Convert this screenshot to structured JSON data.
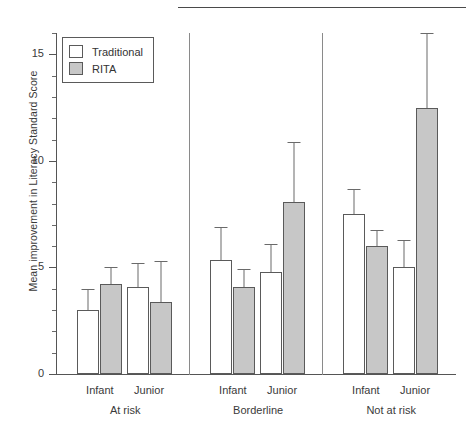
{
  "chart_data": {
    "type": "bar",
    "title": "",
    "xlabel": "",
    "ylabel": "Mean improvement in Literacy Standard Score",
    "ylim": [
      0,
      16
    ],
    "yticks": [
      0,
      5,
      10,
      15
    ],
    "ytick_labels": [
      "0",
      "5",
      "10",
      "15"
    ],
    "minor_tick_step": 1,
    "grid": false,
    "legend_position": "top-left",
    "legend": [
      "Traditional",
      "RITA"
    ],
    "group_labels": [
      "At risk",
      "Borderline",
      "Not at risk"
    ],
    "categories": [
      "At risk / Infant",
      "At risk / Junior",
      "Borderline / Infant",
      "Borderline / Junior",
      "Not at risk / Infant",
      "Not at risk / Junior"
    ],
    "subgroup_labels": [
      "Infant",
      "Junior",
      "Infant",
      "Junior",
      "Infant",
      "Junior"
    ],
    "series": [
      {
        "name": "Traditional",
        "color": "#ffffff",
        "values": [
          3.0,
          4.1,
          5.35,
          4.8,
          7.5,
          5.0
        ],
        "error_upper": [
          4.0,
          5.2,
          6.9,
          6.1,
          8.7,
          6.3
        ]
      },
      {
        "name": "RITA",
        "color": "#c7c7c7",
        "values": [
          4.2,
          3.4,
          4.1,
          8.05,
          6.0,
          12.5
        ],
        "error_upper": [
          5.0,
          5.3,
          4.95,
          10.9,
          6.75,
          16.0
        ]
      }
    ]
  },
  "caption": ""
}
